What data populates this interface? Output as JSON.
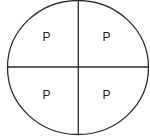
{
  "diagram": {
    "shape": "circle",
    "divisions": 4,
    "colors": {
      "stroke": "#2a2a2a",
      "background": "#ffffff",
      "text": "#222222"
    },
    "quadrants": [
      {
        "position": "top-left",
        "label": "P"
      },
      {
        "position": "top-right",
        "label": "P"
      },
      {
        "position": "bottom-left",
        "label": "P"
      },
      {
        "position": "bottom-right",
        "label": "P"
      }
    ]
  }
}
